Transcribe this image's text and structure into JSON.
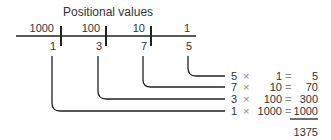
{
  "title": "Positional values",
  "places": [
    {
      "value": "1000",
      "digit": "1"
    },
    {
      "value": "100",
      "digit": "3"
    },
    {
      "value": "10",
      "digit": "7"
    },
    {
      "value": "1",
      "digit": "5"
    }
  ],
  "rows": [
    {
      "digit": "5",
      "times": "×",
      "place": "1",
      "eq": "=",
      "product": "5"
    },
    {
      "digit": "7",
      "times": "×",
      "place": "10",
      "eq": "=",
      "product": "70"
    },
    {
      "digit": "3",
      "times": "×",
      "place": "100",
      "eq": "=",
      "product": "300"
    },
    {
      "digit": "1",
      "times": "×",
      "place": "1000",
      "eq": "=",
      "product": "1000"
    }
  ],
  "total": "1375"
}
